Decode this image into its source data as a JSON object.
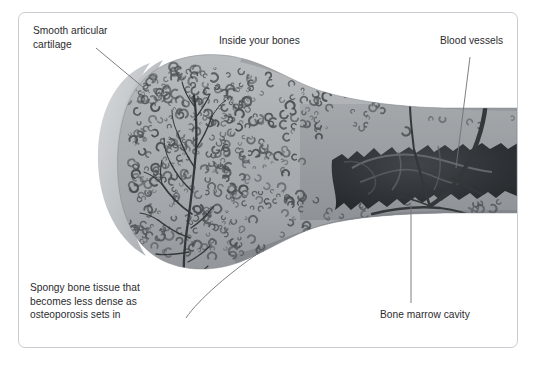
{
  "figure": {
    "title": "Inside your bones",
    "style": "grayscale-anatomical-illustration",
    "frame": {
      "border_color": "#c9ccd1",
      "background": "#ffffff"
    }
  },
  "labels": {
    "cartilage": "Smooth articular\ncartilage",
    "inside": "Inside your bones",
    "vessels": "Blood vessels",
    "spongy": "Spongy bone tissue that\nbecomes less dense as\nosteoporosis sets in",
    "marrow": "Bone marrow cavity"
  },
  "colors": {
    "text": "#2b2b2e",
    "leader_line": "#6e7175",
    "cartilage_outer": "#c8cbcd",
    "cartilage_inner": "#b4b8bb",
    "bone_body": "#a9adb0",
    "cortex": "#8f9396",
    "trabecula": "#4c5053",
    "marrow_cavity": "#2e3134",
    "vessel": "#35383b"
  },
  "parts": [
    {
      "name": "articular-cartilage",
      "description": "light crescent cap at the proximal end"
    },
    {
      "name": "spongy-bone",
      "description": "trabecular c-shaped texture filling the epiphysis"
    },
    {
      "name": "blood-vessel-tree",
      "description": "dark branching vessel entering the epiphysis"
    },
    {
      "name": "bone-marrow-cavity",
      "description": "dark jagged cavity in the shaft"
    },
    {
      "name": "cortical-bone",
      "description": "darker band along the outer shaft edge"
    }
  ]
}
